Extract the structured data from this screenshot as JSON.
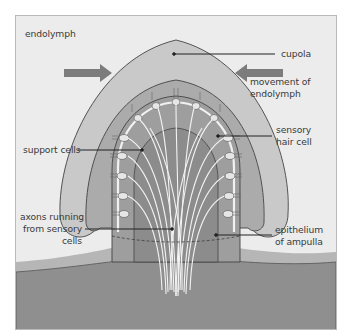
{
  "figure": {
    "type": "anatomical-diagram",
    "colors": {
      "background": "#ececec",
      "cupola_outer": "#c4c4c4",
      "cupola_inner": "#a8a8a8",
      "tissue": "#8f8f8f",
      "wall": "#b3b3b3",
      "arrow": "#7c7c7c",
      "axons": "#f2f2f2",
      "leader": "#222222"
    }
  },
  "labels": {
    "endolymph": "endolymph",
    "cupola": "cupola",
    "movement_line1": "movement of",
    "movement_line2": "endolymph",
    "support_cells": "support cells",
    "sensory_line1": "sensory",
    "sensory_line2": "hair cell",
    "axons_line1": "axons running",
    "axons_line2": "from sensory",
    "axons_line3": "cells",
    "epithelium_line1": "epithelium",
    "epithelium_line2": "of ampulla"
  },
  "arrows": [
    {
      "name": "left-flow-arrow",
      "direction": "right"
    },
    {
      "name": "right-flow-arrow",
      "direction": "left"
    }
  ]
}
